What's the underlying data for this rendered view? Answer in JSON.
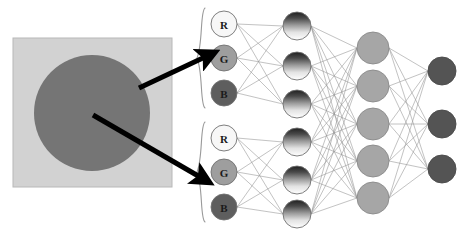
{
  "figure": {
    "name": "cnn-rgb-pixel-to-neural-network-diagram",
    "background": "#ffffff"
  },
  "source_image": {
    "name": "input-image-patch",
    "square": {
      "x": 13,
      "y": 38,
      "w": 159,
      "h": 149,
      "fill": "#d2d2d2",
      "stroke": "#b8b8b8"
    },
    "circle": {
      "cx": 92,
      "cy": 113,
      "r": 58,
      "fill": "#757575"
    }
  },
  "arrows": [
    {
      "name": "arrow-background-pixel-to-input-group-1",
      "x1": 139,
      "y1": 88,
      "x2": 205,
      "y2": 57,
      "color": "#000000",
      "width": 5,
      "description": "arrow from light background pixel to first RGB input group"
    },
    {
      "name": "arrow-circle-pixel-to-input-group-2",
      "x1": 93,
      "y1": 115,
      "x2": 200,
      "y2": 177,
      "color": "#000000",
      "width": 5,
      "description": "arrow from dark circle pixel to second RGB input group"
    }
  ],
  "braces": [
    {
      "name": "brace-input-group-1",
      "x": 205,
      "y_top": 8,
      "y_bottom": 108,
      "color": "#9a9a9a"
    },
    {
      "name": "brace-input-group-2",
      "x": 205,
      "y_top": 122,
      "y_bottom": 222,
      "color": "#9a9a9a"
    }
  ],
  "network": {
    "colors": {
      "edge": "#8c8c8c",
      "node_outline": "#707070",
      "r_fill": "#f7f7f7",
      "g_fill": "#9e9e9e",
      "b_fill": "#5e5e5e",
      "hidden1_gradient_top": "#2b2b2b",
      "hidden1_gradient_bottom": "#ffffff",
      "hidden2_fill": "#a6a6a6",
      "output_fill": "#545454"
    },
    "layers": [
      {
        "name": "input-layer",
        "id": "input",
        "radius": 13,
        "x": 224,
        "nodes": [
          {
            "name": "input-node-r-1",
            "label": "R",
            "cy": 24,
            "fill_key": "r_fill",
            "group": 1
          },
          {
            "name": "input-node-g-1",
            "label": "G",
            "cy": 58,
            "fill_key": "g_fill",
            "group": 1
          },
          {
            "name": "input-node-b-1",
            "label": "B",
            "cy": 93,
            "fill_key": "b_fill",
            "group": 1
          },
          {
            "name": "input-node-r-2",
            "label": "R",
            "cy": 138,
            "fill_key": "r_fill",
            "group": 2
          },
          {
            "name": "input-node-g-2",
            "label": "G",
            "cy": 172,
            "fill_key": "g_fill",
            "group": 2
          },
          {
            "name": "input-node-b-2",
            "label": "B",
            "cy": 207,
            "fill_key": "b_fill",
            "group": 2
          }
        ]
      },
      {
        "name": "hidden-layer-1",
        "id": "hidden1",
        "radius": 14,
        "x": 297,
        "nodes": [
          {
            "name": "hidden1-node-1",
            "label": "",
            "cy": 26
          },
          {
            "name": "hidden1-node-2",
            "label": "",
            "cy": 66
          },
          {
            "name": "hidden1-node-3",
            "label": "",
            "cy": 104
          },
          {
            "name": "hidden1-node-4",
            "label": "",
            "cy": 142
          },
          {
            "name": "hidden1-node-5",
            "label": "",
            "cy": 180
          },
          {
            "name": "hidden1-node-6",
            "label": "",
            "cy": 214
          }
        ]
      },
      {
        "name": "hidden-layer-2",
        "id": "hidden2",
        "radius": 16,
        "x": 373,
        "nodes": [
          {
            "name": "hidden2-node-1",
            "label": "",
            "cy": 48
          },
          {
            "name": "hidden2-node-2",
            "label": "",
            "cy": 86
          },
          {
            "name": "hidden2-node-3",
            "label": "",
            "cy": 124
          },
          {
            "name": "hidden2-node-4",
            "label": "",
            "cy": 161
          },
          {
            "name": "hidden2-node-5",
            "label": "",
            "cy": 198
          }
        ]
      },
      {
        "name": "output-layer",
        "id": "output",
        "radius": 14,
        "x": 442,
        "nodes": [
          {
            "name": "output-node-1",
            "label": "",
            "cy": 71
          },
          {
            "name": "output-node-2",
            "label": "",
            "cy": 124
          },
          {
            "name": "output-node-3",
            "label": "",
            "cy": 169
          }
        ]
      }
    ],
    "connections": [
      {
        "name": "edges-input-to-hidden1",
        "from": "input",
        "to": "hidden1",
        "mode": "grouped"
      },
      {
        "name": "edges-hidden1-to-hidden2",
        "from": "hidden1",
        "to": "hidden2",
        "mode": "full"
      },
      {
        "name": "edges-hidden2-to-output",
        "from": "hidden2",
        "to": "output",
        "mode": "full"
      }
    ]
  }
}
